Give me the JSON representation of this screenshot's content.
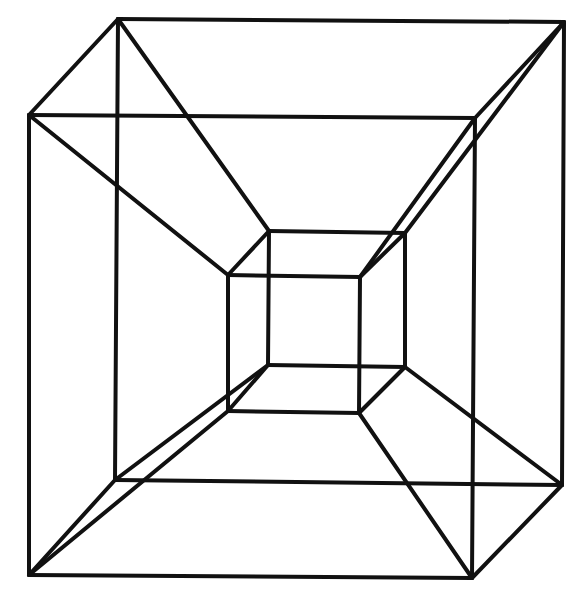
{
  "figure": {
    "stroke_color": "#111111",
    "background_color": "#ffffff",
    "stroke_width": 4,
    "vertices": {
      "A1": [
        118,
        19
      ],
      "A2": [
        564,
        22
      ],
      "A3": [
        562,
        485
      ],
      "A4": [
        115,
        480
      ],
      "B1": [
        29,
        115
      ],
      "B2": [
        475,
        118
      ],
      "B3": [
        472,
        578
      ],
      "B4": [
        29,
        575
      ],
      "C1": [
        269,
        231
      ],
      "C2": [
        405,
        233
      ],
      "C3": [
        405,
        367
      ],
      "C4": [
        268,
        365
      ],
      "D1": [
        228,
        275
      ],
      "D2": [
        360,
        277
      ],
      "D3": [
        359,
        413
      ],
      "D4": [
        228,
        411
      ]
    },
    "edges": [
      [
        "A1",
        "A2"
      ],
      [
        "A2",
        "A3"
      ],
      [
        "A3",
        "A4"
      ],
      [
        "A4",
        "A1"
      ],
      [
        "B1",
        "B2"
      ],
      [
        "B2",
        "B3"
      ],
      [
        "B3",
        "B4"
      ],
      [
        "B4",
        "B1"
      ],
      [
        "C1",
        "C2"
      ],
      [
        "C2",
        "C3"
      ],
      [
        "C3",
        "C4"
      ],
      [
        "C4",
        "C1"
      ],
      [
        "D1",
        "D2"
      ],
      [
        "D2",
        "D3"
      ],
      [
        "D3",
        "D4"
      ],
      [
        "D4",
        "D1"
      ],
      [
        "A1",
        "B1"
      ],
      [
        "A2",
        "B2"
      ],
      [
        "A3",
        "B3"
      ],
      [
        "A4",
        "B4"
      ],
      [
        "C1",
        "D1"
      ],
      [
        "C2",
        "D2"
      ],
      [
        "C3",
        "D3"
      ],
      [
        "C4",
        "D4"
      ],
      [
        "A1",
        "C1"
      ],
      [
        "A2",
        "C2"
      ],
      [
        "A3",
        "C3"
      ],
      [
        "A4",
        "C4"
      ],
      [
        "B1",
        "D1"
      ],
      [
        "B2",
        "D2"
      ],
      [
        "B3",
        "D3"
      ],
      [
        "B4",
        "D4"
      ]
    ]
  }
}
